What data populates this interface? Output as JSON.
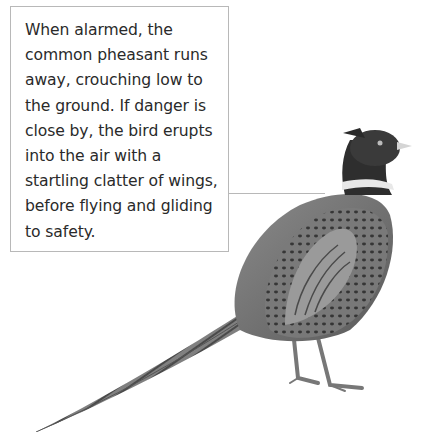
{
  "caption": {
    "text": "When alarmed, the common pheasant runs away, crouching low to the ground. If danger is close by, the bird erupts into the air with a startling clatter of wings, before flying and gliding to safety."
  },
  "illustration": {
    "subject": "common pheasant",
    "style": "grayscale painted illustration",
    "colors": {
      "body": "#6e6e6e",
      "dark": "#2e2e2e",
      "neck_ring": "#e8e8e8",
      "border": "#b8b8b8"
    }
  }
}
